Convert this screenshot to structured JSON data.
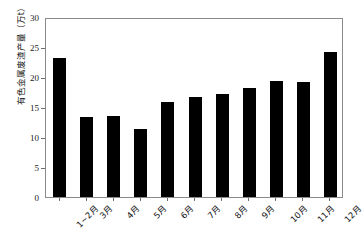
{
  "chart_data": {
    "type": "bar",
    "title": "",
    "subtitle": "",
    "xlabel": "",
    "ylabel": "有色金属废渣产量（万t）",
    "categories": [
      "1~2月",
      "3月",
      "4月",
      "5月",
      "6月",
      "7月",
      "8月",
      "9月",
      "10月",
      "11月",
      "12月"
    ],
    "values": [
      23.1,
      13.3,
      13.5,
      11.4,
      15.9,
      16.7,
      17.1,
      18.1,
      19.4,
      19.2,
      24.2
    ],
    "ylim": [
      0,
      30
    ],
    "yticks": [
      0,
      5,
      10,
      15,
      20,
      25,
      30
    ],
    "ytick_labels": [
      "0",
      "5",
      "10",
      "15",
      "20",
      "25",
      "30"
    ],
    "grid": false,
    "legend": false,
    "legend_position": "none",
    "bar_color": "#000000",
    "frame_color": "#8a8a8a",
    "background_color": "#ffffff",
    "series": [
      {
        "name": "有色金属废渣产量",
        "values": [
          23.1,
          13.3,
          13.5,
          11.4,
          15.9,
          16.7,
          17.1,
          18.1,
          19.4,
          19.2,
          24.2
        ]
      }
    ]
  }
}
